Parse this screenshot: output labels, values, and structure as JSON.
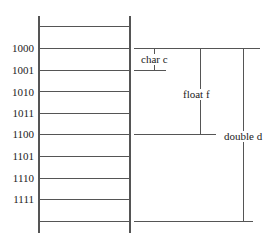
{
  "diagram": {
    "title": "",
    "memory_cells": {
      "addresses": [
        "1000",
        "1001",
        "1010",
        "1011",
        "1100",
        "1101",
        "1110",
        "1111"
      ]
    },
    "variables": [
      {
        "label": "char c",
        "type": "char",
        "name": "c",
        "start": "1000",
        "end": "1001",
        "bytes": 1
      },
      {
        "label": "float f",
        "type": "float",
        "name": "f",
        "start": "1000",
        "end": "1100",
        "bytes": 4
      },
      {
        "label": "double d",
        "type": "double",
        "name": "d",
        "start": "1000",
        "end": "1111",
        "bytes": 8
      }
    ],
    "colors": {
      "line": "#555555",
      "text": "#222222",
      "background": "#ffffff"
    }
  }
}
